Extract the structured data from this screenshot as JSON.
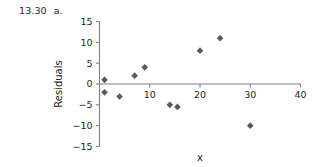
{
  "problem": {
    "number": "13.30",
    "part": "a."
  },
  "chart_data": {
    "type": "scatter",
    "title": "",
    "xlabel": "x",
    "ylabel": "Residuals",
    "xlim": [
      0,
      40
    ],
    "ylim": [
      -15,
      15
    ],
    "x_ticks": [
      0,
      10,
      20,
      30,
      40
    ],
    "x_tick_labels": [
      "",
      "10",
      "20",
      "30",
      "40"
    ],
    "y_ticks": [
      -15,
      -10,
      -5,
      0,
      5,
      10,
      15
    ],
    "y_tick_labels": [
      "-15",
      "-10",
      "-5",
      "0",
      "5",
      "10",
      "15"
    ],
    "grid": false,
    "legend": "none",
    "marker": "diamond",
    "marker_color": "#5a5a5a",
    "points": [
      {
        "x": 1.0,
        "y": 1.0
      },
      {
        "x": 1.0,
        "y": -2.0
      },
      {
        "x": 4.0,
        "y": -3.0
      },
      {
        "x": 7.0,
        "y": 2.0
      },
      {
        "x": 9.0,
        "y": 4.0
      },
      {
        "x": 14.0,
        "y": -5.0
      },
      {
        "x": 15.5,
        "y": -5.5
      },
      {
        "x": 20.0,
        "y": 8.0
      },
      {
        "x": 24.0,
        "y": 11.0
      },
      {
        "x": 30.0,
        "y": -10.0
      }
    ]
  },
  "colors": {
    "axis": "#808080",
    "text": "#231f20",
    "marker": "#5a5a5a",
    "background": "#ffffff"
  }
}
